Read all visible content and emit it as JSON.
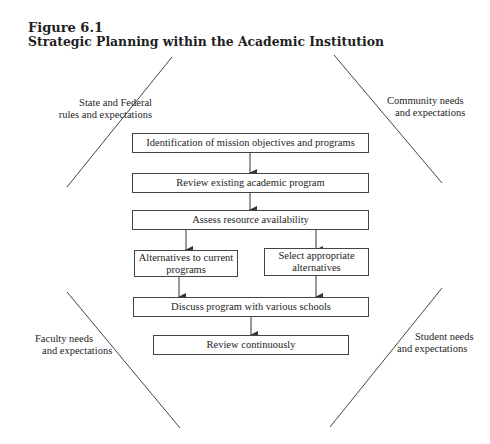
{
  "figure": {
    "number": "Figure 6.1",
    "title": "Strategic Planning within the Academic Institution"
  },
  "context": {
    "top_left": {
      "line1": "State and Federal",
      "line2": "rules and expectations"
    },
    "top_right": {
      "line1": "Community needs",
      "line2": "and expectations"
    },
    "bottom_left": {
      "line1": "Faculty needs",
      "line2": "and expectations"
    },
    "bottom_right": {
      "line1": "Student needs",
      "line2": "and expectations"
    }
  },
  "steps": {
    "identify": "Identification of mission objectives and programs",
    "review_existing": "Review existing academic program",
    "assess": "Assess resource availability",
    "alternatives_1": "Alternatives to current",
    "alternatives_2": "programs",
    "select_1": "Select appropriate",
    "select_2": "alternatives",
    "discuss": "Discuss program with various schools",
    "review_continuous": "Review continuously"
  },
  "colors": {
    "line": "#444444",
    "text": "#1e1e1e",
    "background": "#ffffff"
  }
}
